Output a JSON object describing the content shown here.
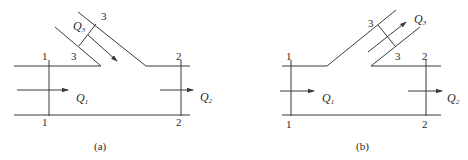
{
  "figure": {
    "panels": [
      {
        "id": "a",
        "caption": "(a)",
        "description": "Branch flow converging into main pipe (combining junction)",
        "section_labels": {
          "s1_top": "1",
          "s1_bottom": "1",
          "s2_top": "2",
          "s2_bottom": "2",
          "s3_outer": "3",
          "s3_inner": "3"
        },
        "flows": {
          "q1": {
            "symbol": "Q",
            "sub": "1",
            "direction": "right"
          },
          "q2": {
            "symbol": "Q",
            "sub": "2",
            "direction": "right"
          },
          "q3": {
            "symbol": "Q",
            "sub": "3",
            "direction": "down-right (into junction)"
          }
        }
      },
      {
        "id": "b",
        "caption": "(b)",
        "description": "Branch flow diverging from main pipe (dividing junction)",
        "section_labels": {
          "s1_top": "1",
          "s1_bottom": "1",
          "s2_top": "2",
          "s2_bottom": "2",
          "s3_outer": "3",
          "s3_inner": "3"
        },
        "flows": {
          "q1": {
            "symbol": "Q",
            "sub": "1",
            "direction": "right"
          },
          "q2": {
            "symbol": "Q",
            "sub": "2",
            "direction": "right"
          },
          "q3": {
            "symbol": "Q",
            "sub": "3",
            "direction": "up-right (out of junction)"
          }
        }
      }
    ],
    "colors": {
      "line": "#3a3a3a",
      "text": "#2a2a2a",
      "background": "#ffffff"
    }
  }
}
